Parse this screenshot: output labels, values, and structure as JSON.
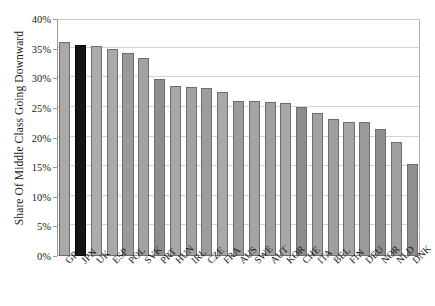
{
  "chart_data": {
    "type": "bar",
    "title": "",
    "xlabel": "",
    "ylabel": "Share Of Middle Class Going Downward",
    "ylim": [
      0,
      40
    ],
    "ytick_labels": [
      "0%",
      "5%",
      "10%",
      "15%",
      "20%",
      "25%",
      "30%",
      "35%",
      "40%"
    ],
    "ytick_values": [
      0,
      5,
      10,
      15,
      20,
      25,
      30,
      35,
      40
    ],
    "grid": true,
    "legend": "none",
    "value_suffix": "%",
    "categories": [
      "GRC",
      "JPN",
      "UK",
      "ESP",
      "POL",
      "SVK",
      "PRT",
      "HUN",
      "IRL",
      "CZE",
      "FRA",
      "AUS",
      "SWE",
      "AUT",
      "KOR",
      "CHE",
      "ITA",
      "BEL",
      "FIN",
      "DEU",
      "NOR",
      "NLD",
      "DNK"
    ],
    "values": [
      36.2,
      35.6,
      35.5,
      35.0,
      34.2,
      33.4,
      29.8,
      28.7,
      28.5,
      28.4,
      27.7,
      26.2,
      26.1,
      26.0,
      25.9,
      25.2,
      24.2,
      23.1,
      22.7,
      22.6,
      21.4,
      19.3,
      15.5
    ],
    "bar_colors": [
      "#a9a9a9",
      "#151515",
      "#acacac",
      "#a9a9a9",
      "#9a9a9a",
      "#a2a2a2",
      "#8f8f8f",
      "#a7a7a7",
      "#a2a2a2",
      "#9c9c9c",
      "#a9a9a9",
      "#9b9b9b",
      "#a4a4a4",
      "#a0a0a0",
      "#a8a8a8",
      "#8d8d8d",
      "#a3a3a3",
      "#9e9e9e",
      "#a6a6a6",
      "#9a9a9a",
      "#8e8e8e",
      "#a0a0a0",
      "#8f8f8f"
    ],
    "highlight_category": "JPN",
    "highlight_color": "#151515",
    "default_bar_color": "#a6a6a6",
    "bar_edge_color": "#6e6e6e",
    "grid_color": "#d3d3d3",
    "axis_color": "#9a9a9a",
    "background": "#ffffff"
  }
}
